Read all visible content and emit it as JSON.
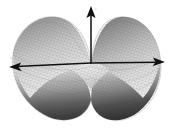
{
  "figure": {
    "title": "",
    "background_color": "#ffffff",
    "width": 171,
    "height": 128,
    "caption": ""
  },
  "chart_data": {
    "type": "surface",
    "title": "",
    "subtitle": "",
    "xlabel": "x",
    "ylabel": "y",
    "zlabel": "z",
    "rendering": "mesh-shaded-grayscale",
    "colormap": "grayscale",
    "colormap_low": "#2e2e2e",
    "colormap_high": "#f2f2f2",
    "grid": false,
    "legend": null,
    "axes_style": "three-arrow-vectors",
    "domain_shape": "circular",
    "surface_formula_hint": "z = x*y style saddle / two-peak bimodal surface",
    "n_peaks": 2,
    "n_valleys": 2,
    "peaks": [
      {
        "label": "left-peak",
        "x_px": 48,
        "y_px": 22,
        "relative_height": 1.0
      },
      {
        "label": "right-peak",
        "x_px": 128,
        "y_px": 27,
        "relative_height": 0.95
      }
    ],
    "valleys": [
      {
        "label": "front-left-valley",
        "x_px": 55,
        "y_px": 108,
        "relative_height": -1.0
      },
      {
        "label": "front-right-valley",
        "x_px": 120,
        "y_px": 104,
        "relative_height": -0.95
      }
    ],
    "xlim": [
      -1,
      1
    ],
    "ylim": [
      -1,
      1
    ],
    "zlim": [
      -1,
      1
    ],
    "tick_labels_x": [],
    "tick_labels_y": [],
    "tick_labels_z": [],
    "annotations": []
  },
  "axes": {
    "vertical": {
      "name": "z-axis",
      "label": "z",
      "label_visible": false,
      "color": "#000000",
      "origin_px": {
        "x": 91,
        "y": 63
      },
      "tip_px": {
        "x": 91,
        "y": 8
      },
      "arrowhead": "up"
    },
    "horizontal_left": {
      "name": "x-axis-negative",
      "label": "x",
      "label_visible": false,
      "color": "#000000",
      "origin_px": {
        "x": 91,
        "y": 63
      },
      "tip_px": {
        "x": 10,
        "y": 67
      },
      "arrowhead": "left"
    },
    "horizontal_right": {
      "name": "y-axis-positive",
      "label": "y",
      "label_visible": false,
      "color": "#000000",
      "origin_px": {
        "x": 91,
        "y": 63
      },
      "tip_px": {
        "x": 164,
        "y": 62
      },
      "arrowhead": "right"
    }
  }
}
